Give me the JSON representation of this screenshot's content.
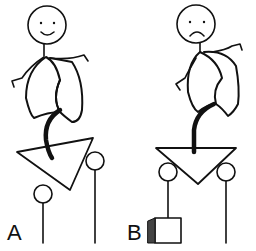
{
  "figure": {
    "panels": [
      {
        "label": "A",
        "face": "smiling",
        "platform": "tilted triangle on two pulleys",
        "weight": "none"
      },
      {
        "label": "B",
        "face": "frowning",
        "platform": "level triangle on two pulleys",
        "weight": "block on left rope"
      }
    ],
    "colors": {
      "line": "#111111",
      "background": "#ffffff",
      "shade": "#555555"
    }
  }
}
